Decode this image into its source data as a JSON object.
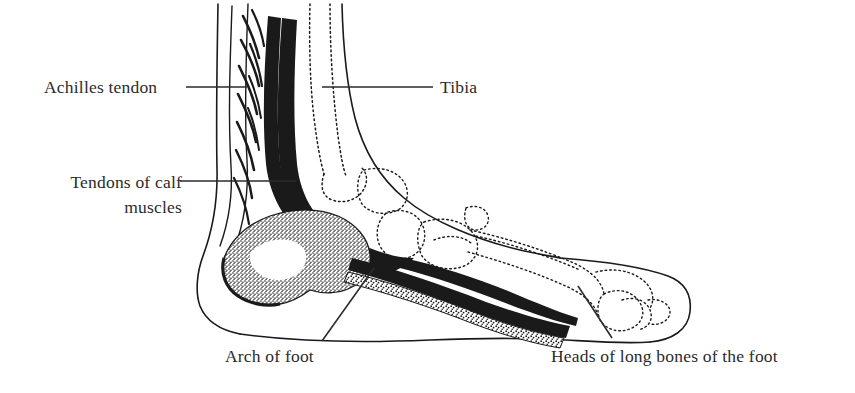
{
  "figure": {
    "background_color": "#ffffff",
    "ink_color": "#1a1a1a",
    "text_color": "#2b2b2b"
  },
  "labels": {
    "achilles_tendon": "Achilles tendon",
    "tendons_of_calf_line1": "Tendons of calf",
    "tendons_of_calf_line2": "muscles",
    "tibia": "Tibia",
    "arch_of_foot": "Arch of foot",
    "heads_of_long_bones": "Heads of long bones of the foot"
  },
  "structures": [
    {
      "name": "achilles-tendon",
      "style": "solid-black-band"
    },
    {
      "name": "calf-muscle-tendons",
      "style": "hatched-fibers"
    },
    {
      "name": "tibia",
      "style": "dotted-bone-outline"
    },
    {
      "name": "calcaneus",
      "style": "stippled-bone"
    },
    {
      "name": "tarsal-bones",
      "style": "dotted-bone-outline"
    },
    {
      "name": "metatarsal-bones",
      "style": "dotted-bone-outline"
    },
    {
      "name": "plantar-fascia",
      "style": "solid-black-band"
    },
    {
      "name": "skin-outline",
      "style": "solid-thin-line"
    }
  ],
  "leader_lines": [
    {
      "name": "achilles-leader",
      "x1": 186,
      "y1": 87,
      "x2": 247,
      "y2": 87
    },
    {
      "name": "tendons-leader",
      "x1": 180,
      "y1": 181,
      "x2": 296,
      "y2": 181
    },
    {
      "name": "tibia-leader",
      "x1": 322,
      "y1": 87,
      "x2": 433,
      "y2": 87
    },
    {
      "name": "arch-leader",
      "x1": 322,
      "y1": 341,
      "x2": 374,
      "y2": 268
    },
    {
      "name": "heads-leader",
      "x1": 612,
      "y1": 338,
      "x2": 578,
      "y2": 286
    }
  ]
}
